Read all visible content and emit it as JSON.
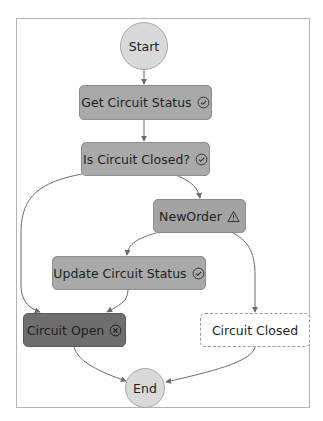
{
  "diagram": {
    "type": "state-machine-graph",
    "colors": {
      "succeeded": "#a9a9a9",
      "failed": "#6e6e6e",
      "caught_error": "#a3a3a3",
      "not_executed": "#ffffff",
      "terminal": "#d9d9d9",
      "edge": "#6b6b6b"
    },
    "nodes": [
      {
        "id": "start",
        "label": "Start",
        "kind": "terminal"
      },
      {
        "id": "get_circuit_status",
        "label": "Get Circuit Status",
        "status": "succeeded",
        "icon": "check-circle-icon"
      },
      {
        "id": "is_circuit_closed",
        "label": "Is Circuit Closed?",
        "status": "succeeded",
        "icon": "check-circle-icon"
      },
      {
        "id": "new_order",
        "label": "NewOrder",
        "status": "caught-error",
        "icon": "warning-triangle-icon"
      },
      {
        "id": "update_circuit_status",
        "label": "Update Circuit Status",
        "status": "succeeded",
        "icon": "check-circle-icon"
      },
      {
        "id": "circuit_open",
        "label": "Circuit Open",
        "status": "failed",
        "icon": "x-circle-icon"
      },
      {
        "id": "circuit_closed",
        "label": "Circuit Closed",
        "status": "not-executed"
      },
      {
        "id": "end",
        "label": "End",
        "kind": "terminal"
      }
    ],
    "edges": [
      {
        "from": "start",
        "to": "get_circuit_status"
      },
      {
        "from": "get_circuit_status",
        "to": "is_circuit_closed"
      },
      {
        "from": "is_circuit_closed",
        "to": "new_order"
      },
      {
        "from": "is_circuit_closed",
        "to": "circuit_open"
      },
      {
        "from": "new_order",
        "to": "update_circuit_status"
      },
      {
        "from": "new_order",
        "to": "circuit_closed"
      },
      {
        "from": "update_circuit_status",
        "to": "circuit_open"
      },
      {
        "from": "circuit_open",
        "to": "end"
      },
      {
        "from": "circuit_closed",
        "to": "end"
      }
    ]
  }
}
